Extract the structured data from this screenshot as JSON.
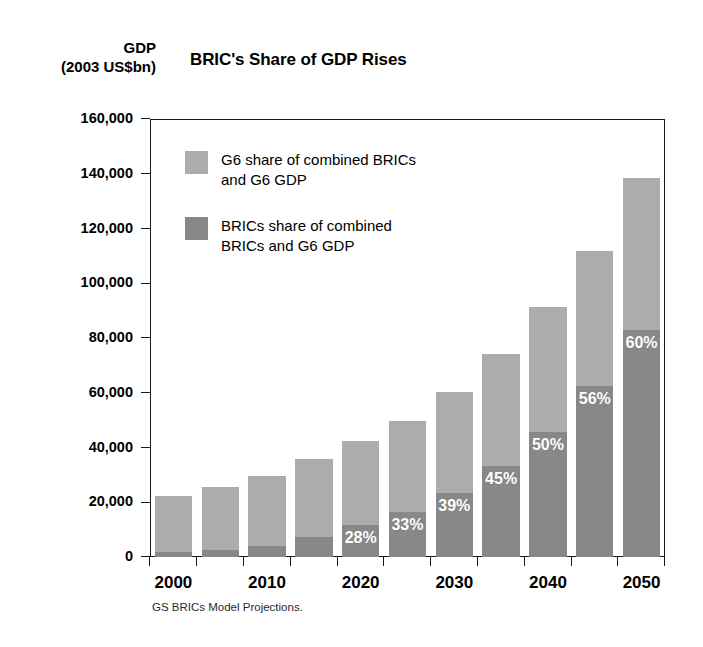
{
  "axis_title": {
    "line1": "GDP",
    "line2": "(2003 US$bn)"
  },
  "title": "BRIC's Share of GDP Rises",
  "footnote": "GS BRICs Model Projections.",
  "colors": {
    "g6": "#acacac",
    "brics": "#888888",
    "axis": "#1a1a1a",
    "label_text": "#ffffff"
  },
  "legend": {
    "position": "inside-top-left",
    "items": [
      {
        "swatch": "#acacac",
        "label": "G6 share of combined BRICs and G6 GDP"
      },
      {
        "swatch": "#888888",
        "label": "BRICs share of combined BRICs and G6 GDP"
      }
    ]
  },
  "chart_data": {
    "type": "bar",
    "stacked": true,
    "title": "BRIC's Share of GDP Rises",
    "xlabel": "",
    "ylabel": "GDP (2003 US$bn)",
    "ylim": [
      0,
      160000
    ],
    "ytick_labels": [
      "0",
      "20,000",
      "40,000",
      "60,000",
      "80,000",
      "100,000",
      "120,000",
      "140,000",
      "160,000"
    ],
    "ytick_values": [
      0,
      20000,
      40000,
      60000,
      80000,
      100000,
      120000,
      140000,
      160000
    ],
    "grid": false,
    "categories": [
      "2000",
      "2005",
      "2010",
      "2015",
      "2020",
      "2025",
      "2030",
      "2035",
      "2040",
      "2045",
      "2050"
    ],
    "xtick_labels": [
      "2000",
      "2010",
      "2020",
      "2030",
      "2040",
      "2050"
    ],
    "xtick_label_categories": [
      "2000",
      "2010",
      "2020",
      "2030",
      "2040",
      "2050"
    ],
    "series": [
      {
        "name": "BRICs share of combined BRICs and G6 GDP",
        "color": "#888888",
        "values": [
          1800,
          2600,
          3900,
          7200,
          11800,
          16400,
          23500,
          33400,
          45600,
          62500,
          83100
        ]
      },
      {
        "name": "G6 share of combined BRICs and G6 GDP",
        "color": "#acacac",
        "values": [
          20600,
          23000,
          25700,
          28500,
          30500,
          33200,
          36700,
          40800,
          45700,
          49200,
          55400
        ]
      }
    ],
    "totals": [
      22400,
      25600,
      29600,
      35700,
      42300,
      49600,
      60200,
      74200,
      91300,
      111700,
      138500
    ],
    "data_labels": [
      {
        "category": "2000",
        "text": ""
      },
      {
        "category": "2005",
        "text": ""
      },
      {
        "category": "2010",
        "text": ""
      },
      {
        "category": "2015",
        "text": ""
      },
      {
        "category": "2020",
        "text": "28%"
      },
      {
        "category": "2025",
        "text": "33%"
      },
      {
        "category": "2030",
        "text": "39%"
      },
      {
        "category": "2035",
        "text": "45%"
      },
      {
        "category": "2040",
        "text": "50%"
      },
      {
        "category": "2045",
        "text": "56%"
      },
      {
        "category": "2050",
        "text": "60%"
      }
    ]
  }
}
